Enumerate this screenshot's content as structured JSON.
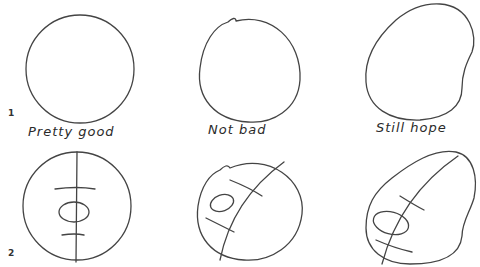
{
  "figure": {
    "rows": [
      {
        "number": "1",
        "description": "Basic head outline shapes"
      },
      {
        "number": "2",
        "description": "Same shapes with construction lines (center line, eye line, oval)"
      }
    ],
    "columns": [
      {
        "label": "Pretty good",
        "shape": "circle"
      },
      {
        "label": "Not bad",
        "shape": "egg with small notch"
      },
      {
        "label": "Still hope",
        "shape": "irregular potato"
      }
    ]
  },
  "colors": {
    "background": "#ffffff",
    "stroke": "#3a3a3a",
    "text": "#2a2a2a"
  }
}
